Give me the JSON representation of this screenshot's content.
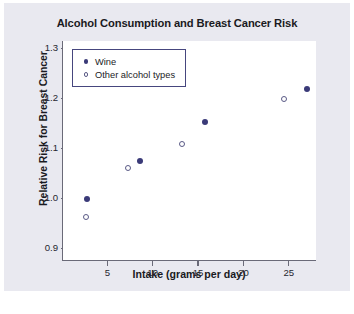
{
  "chart_data": {
    "type": "scatter",
    "title": "Alcohol Consumption and Breast Cancer Risk",
    "xlabel": "Intake (grams per day)",
    "ylabel": "Relative Risk for Breast Cancer",
    "xlim": [
      0,
      28
    ],
    "ylim": [
      0.875,
      1.315
    ],
    "xticks": [
      5,
      10,
      15,
      20,
      25
    ],
    "xtick_labels": [
      "5",
      "10",
      "15",
      "20",
      "25"
    ],
    "yticks": [
      0.9,
      1.0,
      1.1,
      1.2,
      1.3
    ],
    "ytick_labels": [
      "0.9",
      "1.0",
      "1.1",
      "1.2",
      "1.3"
    ],
    "grid": false,
    "legend_position": "top-left",
    "series": [
      {
        "name": "Wine",
        "marker": "filled-circle",
        "color": "#3a3a78",
        "points": [
          {
            "x": 2.7,
            "y": 1.0
          },
          {
            "x": 8.5,
            "y": 1.075
          },
          {
            "x": 15.7,
            "y": 1.153
          },
          {
            "x": 26.9,
            "y": 1.22
          }
        ]
      },
      {
        "name": "Other alcohol types",
        "marker": "open-circle",
        "color": "#5a5a86",
        "points": [
          {
            "x": 2.5,
            "y": 0.963
          },
          {
            "x": 7.2,
            "y": 1.062
          },
          {
            "x": 13.1,
            "y": 1.11
          },
          {
            "x": 24.4,
            "y": 1.199
          }
        ]
      }
    ]
  },
  "legend": {
    "items": [
      {
        "label": "Wine",
        "marker": "filled-circle"
      },
      {
        "label": "Other alcohol types",
        "marker": "open-circle"
      }
    ]
  },
  "colors": {
    "panel_background": "#e9e9f0",
    "plot_background": "#ffffff",
    "axis": "#6a6a78",
    "marker_filled": "#3a3a78",
    "marker_open_stroke": "#5a5a86",
    "legend_border": "#46467e",
    "text": "#1a1a22"
  }
}
